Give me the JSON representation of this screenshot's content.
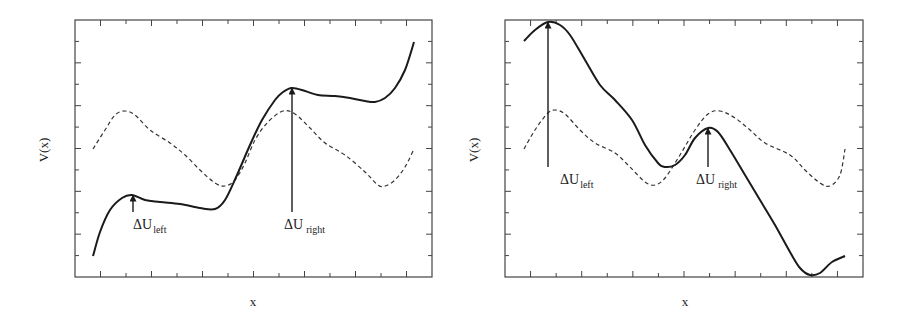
{
  "chart_data": [
    {
      "type": "line",
      "title": "",
      "xlabel": "x",
      "ylabel": "V(x)",
      "grid": false,
      "ticks_labeled": false,
      "series": [
        {
          "name": "tilted potential",
          "style": "solid",
          "color": "#1a1a1a",
          "points": [
            [
              93,
              256
            ],
            [
              100,
              232
            ],
            [
              110,
              210
            ],
            [
              122,
              198
            ],
            [
              132,
              195
            ],
            [
              145,
              200
            ],
            [
              160,
              202
            ],
            [
              180,
              204
            ],
            [
              200,
              208
            ],
            [
              215,
              209
            ],
            [
              225,
              200
            ],
            [
              237,
              175
            ],
            [
              250,
              145
            ],
            [
              262,
              120
            ],
            [
              275,
              100
            ],
            [
              283,
              92
            ],
            [
              292,
              88
            ],
            [
              305,
              91
            ],
            [
              318,
              95
            ],
            [
              335,
              96
            ],
            [
              350,
              98
            ],
            [
              365,
              101
            ],
            [
              375,
              102
            ],
            [
              385,
              98
            ],
            [
              395,
              88
            ],
            [
              405,
              70
            ],
            [
              414,
              42
            ]
          ]
        },
        {
          "name": "untilted potential",
          "style": "dashed",
          "color": "#333333",
          "points": [
            [
              93,
              149
            ],
            [
              105,
              130
            ],
            [
              115,
              115
            ],
            [
              125,
              111
            ],
            [
              135,
              115
            ],
            [
              150,
              130
            ],
            [
              170,
              143
            ],
            [
              185,
              155
            ],
            [
              200,
              170
            ],
            [
              215,
              183
            ],
            [
              225,
              186
            ],
            [
              235,
              180
            ],
            [
              245,
              163
            ],
            [
              255,
              140
            ],
            [
              268,
              122
            ],
            [
              283,
              111
            ],
            [
              295,
              114
            ],
            [
              310,
              128
            ],
            [
              325,
              143
            ],
            [
              345,
              155
            ],
            [
              365,
              172
            ],
            [
              378,
              185
            ],
            [
              385,
              186
            ],
            [
              395,
              180
            ],
            [
              405,
              167
            ],
            [
              414,
              149
            ]
          ]
        }
      ],
      "annotations": [
        {
          "text_main": "ΔU",
          "text_sub": "left",
          "arrow_x": 133,
          "arrow_from_y": 212,
          "arrow_to_y": 195,
          "label_x": 133,
          "label_y": 229
        },
        {
          "text_main": "ΔU",
          "text_sub": "right",
          "arrow_x": 292,
          "arrow_from_y": 212,
          "arrow_to_y": 88,
          "label_x": 284,
          "label_y": 229
        }
      ],
      "frame": {
        "x0": 75,
        "y0": 20,
        "x1": 432,
        "y1": 277
      }
    },
    {
      "type": "line",
      "title": "",
      "xlabel": "x",
      "ylabel": "V(x)",
      "grid": false,
      "ticks_labeled": false,
      "series": [
        {
          "name": "tilted potential",
          "style": "solid",
          "color": "#1a1a1a",
          "points": [
            [
              524,
              41
            ],
            [
              535,
              30
            ],
            [
              548,
              22
            ],
            [
              560,
              25
            ],
            [
              570,
              35
            ],
            [
              585,
              60
            ],
            [
              600,
              85
            ],
            [
              615,
              100
            ],
            [
              632,
              120
            ],
            [
              645,
              145
            ],
            [
              658,
              163
            ],
            [
              665,
              167
            ],
            [
              675,
              165
            ],
            [
              685,
              155
            ],
            [
              695,
              138
            ],
            [
              708,
              128
            ],
            [
              718,
              132
            ],
            [
              730,
              150
            ],
            [
              745,
              175
            ],
            [
              760,
              200
            ],
            [
              775,
              225
            ],
            [
              790,
              252
            ],
            [
              800,
              268
            ],
            [
              810,
              275
            ],
            [
              820,
              273
            ],
            [
              832,
              262
            ],
            [
              845,
              256
            ]
          ]
        },
        {
          "name": "untilted potential",
          "style": "dashed",
          "color": "#333333",
          "points": [
            [
              524,
              149
            ],
            [
              535,
              130
            ],
            [
              547,
              114
            ],
            [
              555,
              110
            ],
            [
              565,
              114
            ],
            [
              580,
              130
            ],
            [
              595,
              143
            ],
            [
              615,
              153
            ],
            [
              630,
              167
            ],
            [
              645,
              182
            ],
            [
              655,
              185
            ],
            [
              665,
              178
            ],
            [
              680,
              155
            ],
            [
              695,
              130
            ],
            [
              708,
              114
            ],
            [
              720,
              111
            ],
            [
              735,
              118
            ],
            [
              750,
              130
            ],
            [
              765,
              143
            ],
            [
              790,
              155
            ],
            [
              805,
              170
            ],
            [
              820,
              183
            ],
            [
              830,
              186
            ],
            [
              840,
              175
            ],
            [
              845,
              149
            ]
          ]
        }
      ],
      "annotations": [
        {
          "text_main": "ΔU",
          "text_sub": "left",
          "arrow_x": 548,
          "arrow_from_y": 167,
          "arrow_to_y": 22,
          "label_x": 560,
          "label_y": 184
        },
        {
          "text_main": "ΔU",
          "text_sub": "right",
          "arrow_x": 708,
          "arrow_from_y": 167,
          "arrow_to_y": 128,
          "label_x": 696,
          "label_y": 184
        }
      ],
      "frame": {
        "x0": 505,
        "y0": 20,
        "x1": 863,
        "y1": 277
      }
    }
  ],
  "labels": {
    "left": {
      "xlabel": "x",
      "ylabel": "V(x)",
      "du_left": "ΔU",
      "du_left_sub": "left",
      "du_right": "ΔU",
      "du_right_sub": "right"
    },
    "right": {
      "xlabel": "x",
      "ylabel": "V(x)",
      "du_left": "ΔU",
      "du_left_sub": "left",
      "du_right": "ΔU",
      "du_right_sub": "right"
    }
  }
}
